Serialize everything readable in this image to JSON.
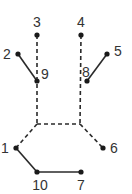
{
  "diagram": {
    "width": 132,
    "height": 194,
    "colors": {
      "line": "#2a2a2a",
      "dot": "#1a1a1a",
      "label": "#333333",
      "background": "#ffffff"
    },
    "nodes": [
      {
        "id": "1",
        "label": "1",
        "x": 16,
        "y": 148,
        "lx": 5,
        "ly": 153
      },
      {
        "id": "2",
        "label": "2",
        "x": 18,
        "y": 54,
        "lx": 7,
        "ly": 59
      },
      {
        "id": "3",
        "label": "3",
        "x": 37,
        "y": 35,
        "lx": 37,
        "ly": 27
      },
      {
        "id": "4",
        "label": "4",
        "x": 81,
        "y": 35,
        "lx": 81,
        "ly": 27
      },
      {
        "id": "5",
        "label": "5",
        "x": 107,
        "y": 54,
        "lx": 118,
        "ly": 56
      },
      {
        "id": "6",
        "label": "6",
        "x": 103,
        "y": 148,
        "lx": 114,
        "ly": 153
      },
      {
        "id": "7",
        "label": "7",
        "x": 81,
        "y": 172,
        "lx": 81,
        "ly": 190
      },
      {
        "id": "8",
        "label": "8",
        "x": 87,
        "y": 81,
        "lx": 86,
        "ly": 77
      },
      {
        "id": "9",
        "label": "9",
        "x": 37,
        "y": 81,
        "lx": 45,
        "ly": 79
      },
      {
        "id": "10",
        "label": "10",
        "x": 37,
        "y": 172,
        "lx": 40,
        "ly": 190
      }
    ],
    "corners": [
      {
        "id": "c-left",
        "x": 37,
        "y": 124
      },
      {
        "id": "c-right",
        "x": 80,
        "y": 124
      }
    ],
    "solid_edges": [
      [
        "2",
        "9"
      ],
      [
        "5",
        "8"
      ],
      [
        "1",
        "10"
      ],
      [
        "10",
        "7"
      ]
    ],
    "dashed_edges": [
      [
        "3",
        "c-left"
      ],
      [
        "4",
        "c-right"
      ],
      [
        "c-left",
        "c-right"
      ],
      [
        "c-left",
        "1"
      ],
      [
        "c-right",
        "6"
      ]
    ]
  }
}
